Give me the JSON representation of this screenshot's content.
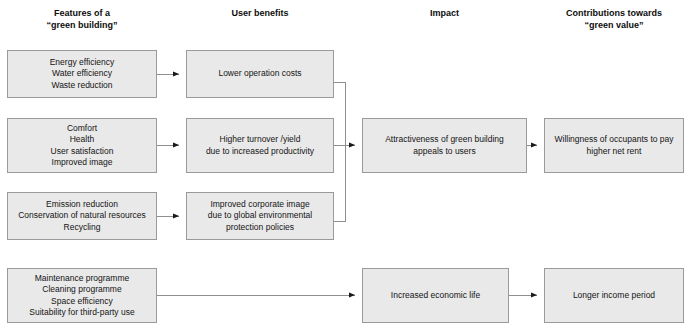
{
  "diagram": {
    "title_row": {
      "columns": [
        {
          "id": "features",
          "label": "Features of a\n“green building”",
          "x": 7,
          "y": 8,
          "w": 150
        },
        {
          "id": "benefits",
          "label": "User benefits",
          "x": 186,
          "y": 8,
          "w": 148
        },
        {
          "id": "impact",
          "label": "Impact",
          "x": 362,
          "y": 8,
          "w": 165
        },
        {
          "id": "contributions",
          "label": "Contributions towards\n“green value”",
          "x": 544,
          "y": 8,
          "w": 140
        }
      ]
    },
    "nodes": [
      {
        "id": "features-1",
        "label": "Energy efficiency\nWater efficiency\nWaste reduction",
        "x": 7,
        "y": 50,
        "w": 150,
        "h": 48
      },
      {
        "id": "features-2",
        "label": "Comfort\nHealth\nUser satisfaction\nImproved image",
        "x": 7,
        "y": 118,
        "w": 150,
        "h": 55
      },
      {
        "id": "features-3",
        "label": "Emission reduction\nConservation of natural resources\nRecycling",
        "x": 7,
        "y": 192,
        "w": 150,
        "h": 48
      },
      {
        "id": "features-4",
        "label": "Maintenance programme\nCleaning programme\nSpace efficiency\nSuitability for third-party use",
        "x": 7,
        "y": 268,
        "w": 150,
        "h": 55
      },
      {
        "id": "benefit-1",
        "label": "Lower operation costs",
        "x": 186,
        "y": 50,
        "w": 148,
        "h": 48
      },
      {
        "id": "benefit-2",
        "label": "Higher turnover /yield\ndue to increased productivity",
        "x": 186,
        "y": 118,
        "w": 148,
        "h": 55
      },
      {
        "id": "benefit-3",
        "label": "Improved corporate image\ndue to global environmental\nprotection policies",
        "x": 186,
        "y": 192,
        "w": 148,
        "h": 48
      },
      {
        "id": "impact-1",
        "label": "Attractiveness of green building\nappeals to users",
        "x": 362,
        "y": 118,
        "w": 165,
        "h": 55
      },
      {
        "id": "impact-2",
        "label": "Increased economic life",
        "x": 362,
        "y": 268,
        "w": 147,
        "h": 55
      },
      {
        "id": "value-1",
        "label": "Willingness of occupants to pay\nhigher net rent",
        "x": 544,
        "y": 118,
        "w": 140,
        "h": 55
      },
      {
        "id": "value-2",
        "label": "Longer income period",
        "x": 544,
        "y": 268,
        "w": 140,
        "h": 55
      }
    ],
    "connectors": [
      {
        "id": "features1-to-benefit1",
        "from": "features-1",
        "to": "benefit-1"
      },
      {
        "id": "features2-to-benefit2",
        "from": "features-2",
        "to": "benefit-2"
      },
      {
        "id": "features3-to-benefit3",
        "from": "features-3",
        "to": "benefit-3"
      },
      {
        "id": "benefits-merge-to-impact1",
        "from": "benefit-1,benefit-2,benefit-3",
        "to": "impact-1"
      },
      {
        "id": "impact1-to-value1",
        "from": "impact-1",
        "to": "value-1"
      },
      {
        "id": "features4-to-impact2",
        "from": "features-4",
        "to": "impact-2"
      },
      {
        "id": "impact2-to-value2",
        "from": "impact-2",
        "to": "value-2"
      }
    ],
    "style": {
      "node_fill": "#e9e9e9",
      "node_stroke": "#9a9a9a",
      "line_color": "#8e8e8e",
      "arrow_color": "#1a1a1a",
      "text_color": "#141414",
      "background": "#ffffff"
    }
  }
}
